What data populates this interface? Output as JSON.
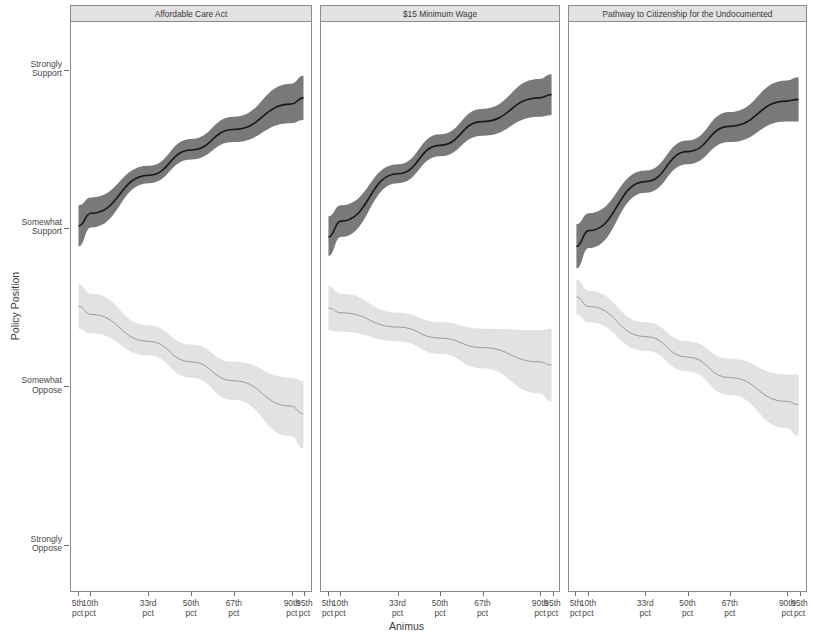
{
  "chart_data": {
    "type": "line",
    "title": "",
    "xlabel": "Animus",
    "ylabel": "Policy Position",
    "grid": false,
    "legend": null,
    "x_tick_labels": [
      "5th pct",
      "10th pct",
      "33rd pct",
      "50th pct",
      "67th pct",
      "90th pct",
      "95th pct"
    ],
    "x_tick_values": [
      5,
      10,
      33,
      50,
      67,
      90,
      95
    ],
    "y_tick_labels": [
      "Strongly Support",
      "Somewhat Support",
      "Somewhat Oppose",
      "Strongly Oppose"
    ],
    "y_tick_values": [
      4,
      3,
      2,
      1
    ],
    "ylim": [
      0.7,
      4.3
    ],
    "xlim": [
      2,
      98
    ],
    "panels": [
      {
        "title": "Affordable Care Act",
        "series": [
          {
            "name": "dark-series",
            "color": "#6e6e6e",
            "line_color": "#1a1a1a",
            "x": [
              5,
              10,
              33,
              50,
              67,
              90,
              95
            ],
            "values": [
              3.01,
              3.09,
              3.33,
              3.49,
              3.62,
              3.78,
              3.82
            ],
            "ci_low": [
              2.88,
              3.0,
              3.28,
              3.43,
              3.54,
              3.66,
              3.68
            ],
            "ci_high": [
              3.14,
              3.19,
              3.39,
              3.56,
              3.7,
              3.91,
              3.96
            ]
          },
          {
            "name": "light-series",
            "color": "#e0e0e0",
            "line_color": "#9a9a9a",
            "x": [
              5,
              10,
              33,
              50,
              67,
              90,
              95
            ],
            "values": [
              2.5,
              2.45,
              2.28,
              2.15,
              2.03,
              1.87,
              1.82
            ],
            "ci_low": [
              2.36,
              2.33,
              2.19,
              2.05,
              1.91,
              1.68,
              1.6
            ],
            "ci_high": [
              2.64,
              2.58,
              2.38,
              2.26,
              2.15,
              2.05,
              2.03
            ]
          }
        ]
      },
      {
        "title": "$15 Minimum Wage",
        "series": [
          {
            "name": "dark-series",
            "color": "#6e6e6e",
            "line_color": "#1a1a1a",
            "x": [
              5,
              10,
              33,
              50,
              67,
              90,
              95
            ],
            "values": [
              2.94,
              3.04,
              3.34,
              3.52,
              3.67,
              3.82,
              3.84
            ],
            "ci_low": [
              2.82,
              2.94,
              3.28,
              3.45,
              3.58,
              3.7,
              3.71
            ],
            "ci_high": [
              3.07,
              3.14,
              3.4,
              3.59,
              3.75,
              3.94,
              3.97
            ]
          },
          {
            "name": "light-series",
            "color": "#e0e0e0",
            "line_color": "#9a9a9a",
            "x": [
              5,
              10,
              33,
              50,
              67,
              90,
              95
            ],
            "values": [
              2.49,
              2.46,
              2.37,
              2.3,
              2.24,
              2.15,
              2.13
            ],
            "ci_low": [
              2.35,
              2.34,
              2.28,
              2.2,
              2.11,
              1.95,
              1.9
            ],
            "ci_high": [
              2.63,
              2.58,
              2.46,
              2.4,
              2.36,
              2.35,
              2.36
            ]
          }
        ]
      },
      {
        "title": "Pathway to Citizenship for the Undocumented",
        "series": [
          {
            "name": "dark-series",
            "color": "#6e6e6e",
            "line_color": "#1a1a1a",
            "x": [
              5,
              10,
              33,
              50,
              67,
              90,
              95
            ],
            "values": [
              2.88,
              2.98,
              3.29,
              3.48,
              3.64,
              3.8,
              3.81
            ],
            "ci_low": [
              2.74,
              2.87,
              3.22,
              3.4,
              3.54,
              3.67,
              3.67
            ],
            "ci_high": [
              3.02,
              3.09,
              3.36,
              3.55,
              3.73,
              3.93,
              3.95
            ]
          },
          {
            "name": "light-series",
            "color": "#e0e0e0",
            "line_color": "#9a9a9a",
            "x": [
              5,
              10,
              33,
              50,
              67,
              90,
              95
            ],
            "values": [
              2.56,
              2.5,
              2.31,
              2.18,
              2.05,
              1.9,
              1.88
            ],
            "ci_low": [
              2.45,
              2.4,
              2.22,
              2.09,
              1.94,
              1.73,
              1.68
            ],
            "ci_high": [
              2.67,
              2.6,
              2.4,
              2.28,
              2.17,
              2.07,
              2.07
            ]
          }
        ]
      }
    ]
  },
  "axis": {
    "y_title": "Policy Position",
    "x_title": "Animus",
    "y_ticks": [
      {
        "line1": "Strongly",
        "line2": "Support"
      },
      {
        "line1": "Somewhat",
        "line2": "Support"
      },
      {
        "line1": "Somewhat",
        "line2": "Oppose"
      },
      {
        "line1": "Strongly",
        "line2": "Oppose"
      }
    ],
    "x_ticks": [
      {
        "line1": "5th",
        "line2": "pct"
      },
      {
        "line1": "10th",
        "line2": "pct"
      },
      {
        "line1": "33rd",
        "line2": "pct"
      },
      {
        "line1": "50th",
        "line2": "pct"
      },
      {
        "line1": "67th",
        "line2": "pct"
      },
      {
        "line1": "90th",
        "line2": "pct"
      },
      {
        "line1": "95th",
        "line2": "pct"
      }
    ]
  },
  "style": {
    "strip_fill": "#e2e2e2",
    "border": "#8a8a8a",
    "dark_band": "#6e6e6e",
    "dark_line": "#1a1a1a",
    "light_band": "#e0e0e0",
    "light_line": "#9a9a9a",
    "background": "#ffffff"
  }
}
